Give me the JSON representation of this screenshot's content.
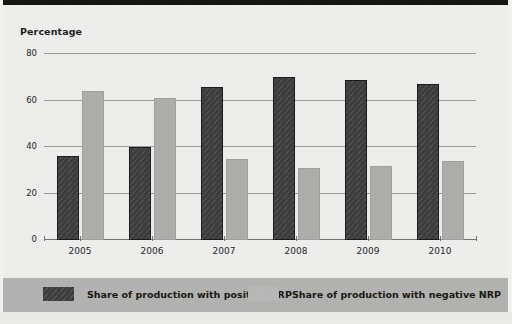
{
  "chart_data": {
    "type": "bar",
    "title": "Percentage",
    "xlabel": "",
    "ylabel": "Percentage",
    "categories": [
      "2005",
      "2006",
      "2007",
      "2008",
      "2009",
      "2010"
    ],
    "series": [
      {
        "name": "Share of production with positive NRP",
        "color": "#3b3b3b",
        "values": [
          36,
          40,
          66,
          70,
          69,
          67
        ]
      },
      {
        "name": "Share of production with negative NRP",
        "color": "#adadab",
        "values": [
          64,
          61,
          35,
          31,
          32,
          34
        ]
      }
    ],
    "ylim": [
      0,
      80
    ],
    "yticks": [
      0,
      20,
      40,
      60,
      80
    ],
    "ytick_labels": [
      "0",
      "20",
      "40",
      "60",
      "80"
    ],
    "grid": true,
    "legend_position": "bottom"
  },
  "legend": {
    "entries": [
      {
        "label": "Share of production with positive NRP",
        "swatch": "positive"
      },
      {
        "label": "Share of production with negative NRP",
        "swatch": "negative"
      }
    ]
  },
  "colors": {
    "background": "#efefed",
    "legend_band": "#b2b2b0",
    "positive_bar": "#3b3b3b",
    "negative_bar": "#adadab",
    "gridline": "#9a9a98",
    "text": "#1d1d1d"
  }
}
